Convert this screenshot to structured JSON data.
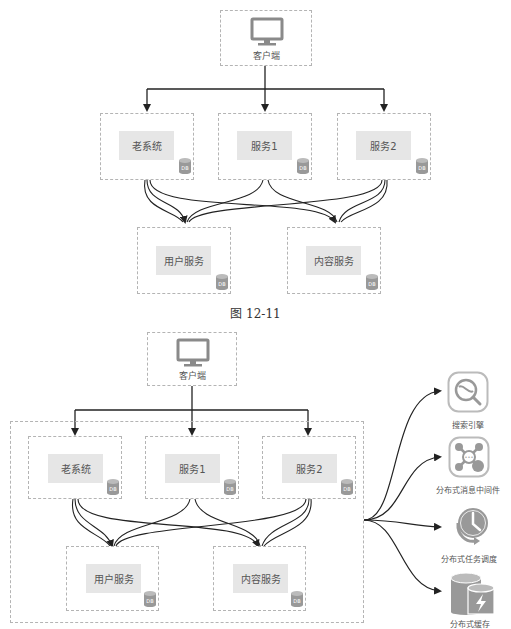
{
  "figure1": {
    "client": {
      "label": "客户端",
      "icon": "monitor-icon"
    },
    "services": [
      {
        "label": "老系统",
        "db": "DB"
      },
      {
        "label": "服务1",
        "db": "DB"
      },
      {
        "label": "服务2",
        "db": "DB"
      }
    ],
    "backends": [
      {
        "label": "用户服务",
        "db": "DB"
      },
      {
        "label": "内容服务",
        "db": "DB"
      }
    ],
    "caption": "图 12-11"
  },
  "figure2": {
    "client": {
      "label": "客户端",
      "icon": "monitor-icon"
    },
    "services": [
      {
        "label": "老系统",
        "db": "DB"
      },
      {
        "label": "服务1",
        "db": "DB"
      },
      {
        "label": "服务2",
        "db": "DB"
      }
    ],
    "backends": [
      {
        "label": "用户服务",
        "db": "DB"
      },
      {
        "label": "内容服务",
        "db": "DB"
      }
    ],
    "external": [
      {
        "label": "搜索引擎",
        "icon": "search-engine-icon"
      },
      {
        "label": "分布式消息中间件",
        "icon": "message-middleware-icon"
      },
      {
        "label": "分布式任务调度",
        "icon": "task-scheduler-icon"
      },
      {
        "label": "分布式缓存",
        "icon": "distributed-cache-icon"
      }
    ]
  },
  "colors": {
    "line": "#222222",
    "dash": "#b4b4b4",
    "label_bg": "#e6e6e6",
    "icon": "#8a8a8a"
  }
}
